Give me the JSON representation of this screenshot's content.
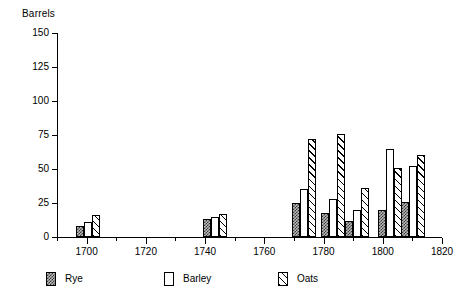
{
  "chart_data": {
    "type": "bar",
    "title": "",
    "xlabel": "",
    "ylabel": "Barrels",
    "ylim": [
      0,
      150
    ],
    "xlim": [
      1690,
      1820
    ],
    "ytick_values": [
      0,
      25,
      50,
      75,
      100,
      125,
      150
    ],
    "ytick_labels": [
      "0",
      "25",
      "50",
      "75",
      "100",
      "125",
      "150"
    ],
    "xtick_major_values": [
      1700,
      1720,
      1740,
      1760,
      1780,
      1800,
      1820
    ],
    "xtick_major_labels": [
      "1700",
      "1720",
      "1740",
      "1760",
      "1780",
      "1800",
      "1820"
    ],
    "xtick_minor_values": [
      1690,
      1710,
      1730,
      1750,
      1770,
      1790,
      1810
    ],
    "grid": false,
    "legend_position": "below-axes",
    "series": [
      {
        "name": "Rye",
        "pattern": "checker",
        "values": [
          8,
          13,
          25,
          18,
          12,
          20,
          26
        ]
      },
      {
        "name": "Barley",
        "pattern": "empty",
        "values": [
          11,
          15,
          35,
          28,
          20,
          65,
          52
        ]
      },
      {
        "name": "Oats",
        "pattern": "hatch",
        "values": [
          16,
          17,
          72,
          76,
          36,
          51,
          60
        ]
      }
    ],
    "groups": [
      {
        "year": 1699,
        "label": "1699"
      },
      {
        "year": 1742,
        "label": "1742"
      },
      {
        "year": 1772,
        "label": "1772"
      },
      {
        "year": 1782,
        "label": "1782"
      },
      {
        "year": 1790,
        "label": "1790"
      },
      {
        "year": 1801,
        "label": "1801"
      },
      {
        "year": 1809,
        "label": "1809"
      }
    ]
  },
  "legend": {
    "items": [
      {
        "label": "Rye"
      },
      {
        "label": "Barley"
      },
      {
        "label": "Oats"
      }
    ]
  }
}
